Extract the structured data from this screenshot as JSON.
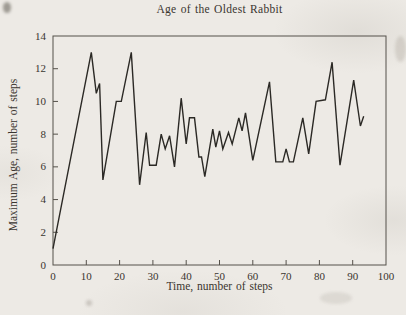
{
  "page": {
    "paper_hex": "#edeae5",
    "ink_hex": "#3a352f"
  },
  "chart_data": {
    "type": "line",
    "title": "Age of the Oldest Rabbit",
    "xlabel": "Time, number of steps",
    "ylabel": "Maximum Age, number of steps",
    "xlim": [
      0,
      100
    ],
    "ylim": [
      0,
      14
    ],
    "x_ticks": [
      0,
      10,
      20,
      30,
      40,
      50,
      60,
      70,
      80,
      90,
      100
    ],
    "y_ticks": [
      0,
      2,
      4,
      6,
      8,
      10,
      12,
      14
    ],
    "grid": false,
    "legend": null,
    "line_color_hex": "#2b2925",
    "axis_color_hex": "#55514a",
    "points": [
      [
        0,
        1
      ],
      [
        11.5,
        13
      ],
      [
        13,
        10.5
      ],
      [
        14,
        11.1
      ],
      [
        15,
        5.2
      ],
      [
        19,
        10
      ],
      [
        20.5,
        10
      ],
      [
        23.5,
        13
      ],
      [
        26,
        4.9
      ],
      [
        28,
        8.1
      ],
      [
        29,
        6.1
      ],
      [
        31,
        6.1
      ],
      [
        32.5,
        8
      ],
      [
        33.7,
        7.1
      ],
      [
        35,
        7.9
      ],
      [
        36.5,
        6
      ],
      [
        38.5,
        10.2
      ],
      [
        40,
        7.4
      ],
      [
        41,
        9
      ],
      [
        42.5,
        9
      ],
      [
        43.8,
        6.6
      ],
      [
        44.6,
        6.6
      ],
      [
        45.6,
        5.4
      ],
      [
        48,
        8.3
      ],
      [
        48.9,
        7.2
      ],
      [
        50,
        8.2
      ],
      [
        51,
        7.1
      ],
      [
        52.7,
        8.1
      ],
      [
        53.8,
        7.4
      ],
      [
        55.8,
        9
      ],
      [
        56.8,
        8.2
      ],
      [
        57.8,
        9.3
      ],
      [
        60,
        6.4
      ],
      [
        65,
        11.2
      ],
      [
        66.9,
        6.3
      ],
      [
        69,
        6.3
      ],
      [
        70,
        7.1
      ],
      [
        71,
        6.3
      ],
      [
        72.2,
        6.3
      ],
      [
        75,
        9
      ],
      [
        76.8,
        6.8
      ],
      [
        79,
        10
      ],
      [
        81.8,
        10.1
      ],
      [
        83.8,
        12.4
      ],
      [
        86.2,
        6.1
      ],
      [
        90.3,
        11.3
      ],
      [
        92.3,
        8.5
      ],
      [
        93.3,
        9.1
      ]
    ]
  }
}
